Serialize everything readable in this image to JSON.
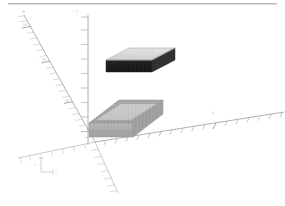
{
  "viewport": {
    "title": "3D Box Viewport",
    "background_color": "#ffffff",
    "width": 285,
    "height": 206
  },
  "header": {
    "rule_color": "#b8b8b8",
    "mark_left": "a",
    "mark_right": "—|"
  },
  "axes": {
    "origin": {
      "x": 95,
      "y": 142
    },
    "line_color": "#9d9d9d",
    "tick_color": "#b4b4b4",
    "label_color": "#bdbdbd",
    "list": [
      {
        "name": "x-axis",
        "label": "x",
        "direction": "right-up",
        "start": {
          "x": 95,
          "y": 142
        },
        "end": {
          "x": 284,
          "y": 112
        },
        "tick_count": 17,
        "label_pos": {
          "x": 214,
          "y": 111
        },
        "label_text": "0"
      },
      {
        "name": "y-axis",
        "label": "y",
        "direction": "upper-left",
        "start": {
          "x": 95,
          "y": 142
        },
        "end": {
          "x": 24,
          "y": 15
        },
        "tick_count": 22,
        "major_ticks": [
          {
            "t": 0.88,
            "text": "50"
          },
          {
            "t": 0.58,
            "text": "30"
          },
          {
            "t": 0.25,
            "text": "10"
          }
        ]
      },
      {
        "name": "y-axis-negative",
        "label": "-y",
        "direction": "lower-right",
        "start": {
          "x": 95,
          "y": 142
        },
        "end": {
          "x": 118,
          "y": 193
        },
        "tick_count": 7
      },
      {
        "name": "z-axis",
        "label": "z",
        "direction": "up",
        "start": {
          "x": 88,
          "y": 145
        },
        "end": {
          "x": 88,
          "y": 15
        },
        "tick_count": 9
      },
      {
        "name": "x-axis-negative",
        "label": "-x",
        "direction": "left-down",
        "start": {
          "x": 95,
          "y": 142
        },
        "end": {
          "x": 18,
          "y": 158
        },
        "tick_count": 7
      }
    ]
  },
  "objects": [
    {
      "name": "upper-box",
      "description": "floating rectangular box, light top face, dark front and side faces",
      "top_face_color": "#d8d8d8",
      "front_face_color": "#1a1a1a",
      "side_face_color": "#3a3a3a",
      "edge_color": "#707070",
      "bounds": {
        "x": 106,
        "y": 48,
        "width": 69,
        "height": 32
      }
    },
    {
      "name": "lower-box",
      "description": "rectangular box resting at origin plane, uniform grey hatched faces",
      "top_face_color": "#9c9c9c",
      "inner_face_color": "#c4c4c4",
      "front_face_color": "#a8a8a8",
      "side_face_color": "#9a9a9a",
      "edge_color": "#8a8a8a",
      "bounds": {
        "x": 89,
        "y": 100,
        "width": 74,
        "height": 42
      }
    }
  ],
  "gizmo": {
    "name": "axis-indicator",
    "position": {
      "x": 38,
      "y": 160
    },
    "labels": {
      "vertical": "z",
      "horizontal": "x"
    },
    "color": "#c2c2c2"
  }
}
